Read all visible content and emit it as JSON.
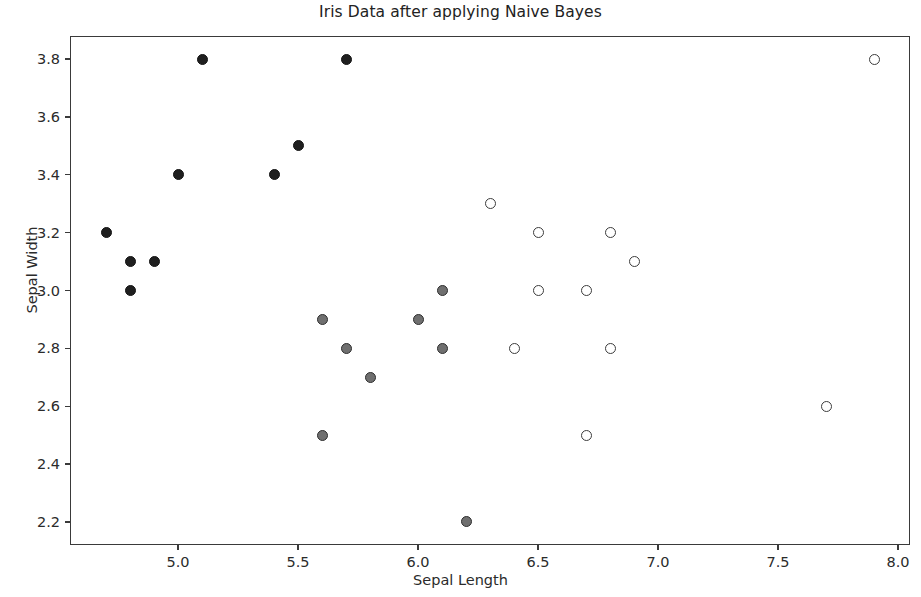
{
  "chart_data": {
    "type": "scatter",
    "title": "Iris Data after applying Naive Bayes",
    "xlabel": "Sepal Length",
    "ylabel": "Sepal Width",
    "xlim": [
      4.55,
      8.05
    ],
    "ylim": [
      2.12,
      3.88
    ],
    "xticks": [
      "5.0",
      "5.5",
      "6.0",
      "6.5",
      "7.0",
      "7.5",
      "8.0"
    ],
    "xtick_values": [
      5.0,
      5.5,
      6.0,
      6.5,
      7.0,
      7.5,
      8.0
    ],
    "yticks": [
      "2.2",
      "2.4",
      "2.6",
      "2.8",
      "3.0",
      "3.2",
      "3.4",
      "3.6",
      "3.8"
    ],
    "ytick_values": [
      2.2,
      2.4,
      2.6,
      2.8,
      3.0,
      3.2,
      3.4,
      3.6,
      3.8
    ],
    "grid": false,
    "legend": null,
    "marker_styles": {
      "filled": "#1f1f1f",
      "gray": "#6f6f6f",
      "hollow": "#ffffff"
    },
    "series": [
      {
        "name": "class-0",
        "marker": "filled",
        "points": [
          [
            4.7,
            3.2
          ],
          [
            4.8,
            3.1
          ],
          [
            4.9,
            3.1
          ],
          [
            4.8,
            3.0
          ],
          [
            5.0,
            3.4
          ],
          [
            5.1,
            3.8
          ],
          [
            5.4,
            3.4
          ],
          [
            5.5,
            3.5
          ],
          [
            5.7,
            3.8
          ]
        ]
      },
      {
        "name": "class-1",
        "marker": "gray",
        "points": [
          [
            5.6,
            2.9
          ],
          [
            5.6,
            2.5
          ],
          [
            5.7,
            2.8
          ],
          [
            5.8,
            2.7
          ],
          [
            6.0,
            2.9
          ],
          [
            6.1,
            3.0
          ],
          [
            6.1,
            2.8
          ],
          [
            6.2,
            2.2
          ]
        ]
      },
      {
        "name": "class-2",
        "marker": "hollow",
        "points": [
          [
            6.3,
            3.3
          ],
          [
            6.4,
            2.8
          ],
          [
            6.5,
            3.2
          ],
          [
            6.5,
            3.0
          ],
          [
            6.7,
            3.0
          ],
          [
            6.7,
            2.5
          ],
          [
            6.8,
            3.2
          ],
          [
            6.8,
            2.8
          ],
          [
            6.9,
            3.1
          ],
          [
            7.7,
            2.6
          ],
          [
            7.9,
            3.8
          ]
        ]
      }
    ]
  }
}
